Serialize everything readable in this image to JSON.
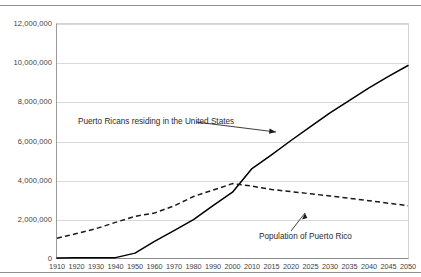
{
  "chart_data": {
    "type": "line",
    "title": "",
    "subtitle": "",
    "xlabel": "",
    "ylabel": "",
    "grid": true,
    "legend_position": "none",
    "categories": [
      "1910",
      "1920",
      "1930",
      "1940",
      "1950",
      "1960",
      "1970",
      "1980",
      "1990",
      "2000",
      "2010",
      "2015",
      "2020",
      "2025",
      "2030",
      "2035",
      "2040",
      "2045",
      "2050"
    ],
    "ylim": [
      0,
      12000000
    ],
    "ytick_labels": [
      "12,000,000",
      "10,000,000",
      "8,000,000",
      "6,000,000",
      "4,000,000",
      "2,000,000",
      "0"
    ],
    "ytick_values": [
      12000000,
      10000000,
      8000000,
      6000000,
      4000000,
      2000000,
      0
    ],
    "series": [
      {
        "name": "Puerto Ricans residing in the United States",
        "style": "solid",
        "color": "#000000",
        "values": [
          55000,
          60000,
          65000,
          70000,
          300000,
          900000,
          1450000,
          2010000,
          2730000,
          3410000,
          4620000,
          5320000,
          6050000,
          6760000,
          7460000,
          8100000,
          8740000,
          9330000,
          9880000
        ]
      },
      {
        "name": "Population of Puerto Rico",
        "style": "dashed",
        "color": "#1a1a1a",
        "values": [
          1060000,
          1300000,
          1550000,
          1870000,
          2180000,
          2350000,
          2710000,
          3190000,
          3520000,
          3850000,
          3720000,
          3550000,
          3440000,
          3330000,
          3220000,
          3100000,
          2980000,
          2850000,
          2720000
        ]
      }
    ],
    "annotations": [
      {
        "id": "us-label",
        "text": "Puerto Ricans residing in the United States",
        "arrow": "down-right"
      },
      {
        "id": "pr-label",
        "text": "Population of Puerto Rico",
        "arrow": "up-right"
      }
    ]
  }
}
